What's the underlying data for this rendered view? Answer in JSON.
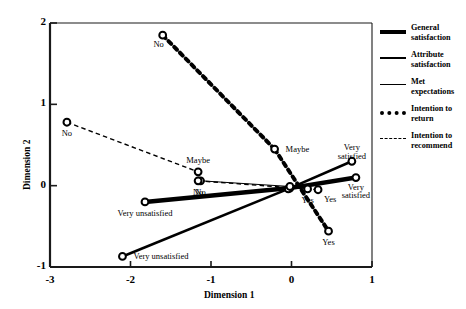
{
  "chart_data": {
    "type": "line",
    "title": "",
    "xlabel": "Dimension 1",
    "ylabel": "Dimension 2",
    "xlim": [
      -3,
      1
    ],
    "ylim": [
      -1,
      2
    ],
    "xticks": [
      "-3",
      "-2",
      "-1",
      "0",
      "1"
    ],
    "xtick_values": [
      -3,
      -2,
      -1,
      0,
      1
    ],
    "yticks": [
      "2",
      "1",
      "0",
      "-1"
    ],
    "ytick_values": [
      2,
      1,
      0,
      -1
    ],
    "grid": false,
    "legend_position": "right",
    "marker": "open-circle",
    "series": [
      {
        "name": "General satisfaction",
        "style": "solid",
        "width": 4.5,
        "points": [
          {
            "label": "Very unsatisfied",
            "x": -1.82,
            "y": -0.2,
            "label_pos": "below"
          },
          {
            "label": "",
            "x": -0.02,
            "y": -0.03,
            "label_pos": "none"
          },
          {
            "label": "Very satisfied",
            "x": 0.8,
            "y": 0.1,
            "label_pos": "below"
          }
        ]
      },
      {
        "name": "Attribute satisfaction",
        "style": "solid",
        "width": 2.6,
        "points": [
          {
            "label": "Very unsatisfied",
            "x": -2.1,
            "y": -0.87,
            "label_pos": "right"
          },
          {
            "label": "",
            "x": -0.04,
            "y": -0.04,
            "label_pos": "none"
          },
          {
            "label": "Very satisfied",
            "x": 0.75,
            "y": 0.3,
            "label_pos": "above"
          }
        ]
      },
      {
        "name": "Met expectations",
        "style": "solid",
        "width": 1.0,
        "points": [
          {
            "label": "No",
            "x": -1.13,
            "y": 0.06,
            "label_pos": "below"
          },
          {
            "label": "",
            "x": -0.02,
            "y": -0.01,
            "label_pos": "none"
          },
          {
            "label": "Yes",
            "x": 0.2,
            "y": -0.04,
            "label_pos": "below"
          }
        ]
      },
      {
        "name": "Intention to return",
        "style": "dotted",
        "width": 4.0,
        "points": [
          {
            "label": "No",
            "x": -1.6,
            "y": 1.85,
            "label_pos": "below-left"
          },
          {
            "label": "Maybe",
            "x": -0.21,
            "y": 0.45,
            "label_pos": "right"
          },
          {
            "label": "Yes",
            "x": 0.46,
            "y": -0.56,
            "label_pos": "below"
          }
        ]
      },
      {
        "name": "Intention to recommend",
        "style": "dashed",
        "width": 1.4,
        "points": [
          {
            "label": "No",
            "x": -2.79,
            "y": 0.78,
            "label_pos": "below"
          },
          {
            "label": "Maybe",
            "x": -1.16,
            "y": 0.17,
            "label_pos": "above"
          },
          {
            "label": "No",
            "x": -1.16,
            "y": 0.06,
            "label_pos": "below"
          },
          {
            "label": "Yes",
            "x": 0.33,
            "y": -0.05,
            "label_pos": "below-right"
          }
        ]
      }
    ],
    "annotations": []
  },
  "legend": {
    "items": [
      {
        "label": "General satisfaction",
        "key": "general"
      },
      {
        "label": "Attribute satisfaction",
        "key": "attribute"
      },
      {
        "label": "Met expectations",
        "key": "met"
      },
      {
        "label": "Intention to return",
        "key": "return"
      },
      {
        "label": "Intention to recommend",
        "key": "recommend"
      }
    ]
  },
  "colors": {
    "line": "#000000",
    "axis": "#1a1a1a",
    "background": "#ffffff"
  }
}
